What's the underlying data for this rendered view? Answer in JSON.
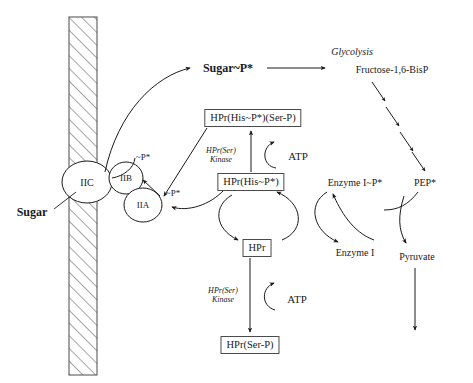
{
  "diagram": {
    "background": "#ffffff",
    "stroke": "#1a1a1a",
    "box_stroke": "#4a4a4a"
  },
  "membrane": {
    "name": "cell-membrane",
    "hatch_label": "diagonal-hatch"
  },
  "transporter": {
    "iic": "IIC",
    "iib": "IIB",
    "iia": "IIA",
    "iib_phospho": "~P*",
    "iia_phospho": "~P*"
  },
  "labels": {
    "sugar": "Sugar",
    "sugar_p": "Sugar~P*",
    "glycolysis": "Glycolysis",
    "fructose": "Fructose-1,6-BisP",
    "pep": "PEP*",
    "pyruvate": "Pyruvate",
    "enzyme_i_p": "Enzyme I~P*",
    "enzyme_i": "Enzyme I",
    "atp_upper": "ATP",
    "atp_lower": "ATP"
  },
  "boxes": {
    "hpr_his_ser": "HPr(His~P*)(Ser-P)",
    "hpr_his": "HPr(His~P*)",
    "hpr": "HPr",
    "hpr_ser": "HPr(Ser-P)"
  },
  "kinase": {
    "upper_line1": "HPr(Ser)",
    "upper_line2": "Kinase",
    "lower_line1": "HPr(Ser)",
    "lower_line2": "Kinase"
  }
}
